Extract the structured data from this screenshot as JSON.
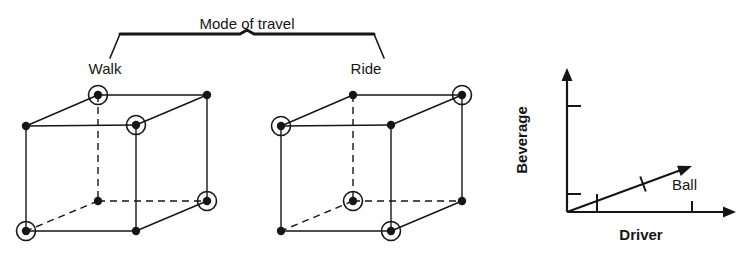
{
  "figure": {
    "width": 750,
    "height": 256,
    "background": "#ffffff",
    "ink_color": "#161616"
  },
  "factor_title": {
    "label": "Mode of travel",
    "x": 247,
    "y": 18
  },
  "groups": [
    {
      "id": "walk",
      "label": "Walk",
      "label_x": 105,
      "label_y": 74
    },
    {
      "id": "ride",
      "label": "Ride",
      "label_x": 366,
      "label_y": 74
    }
  ],
  "brace": {
    "left_x": 120,
    "right_x": 374,
    "top_y": 34,
    "tip_y": 30,
    "foot_y": 58,
    "center_x": 247
  },
  "cubes": [
    {
      "id": "cube-walk",
      "group": "Walk",
      "origin_x": 26,
      "front_top_y": 126,
      "front_bottom_y": 231,
      "front_width": 110,
      "depth_dx": 71,
      "depth_dy": -31,
      "vertices": [
        {
          "name": "front-top-left",
          "x": 26,
          "y": 126,
          "circled": false
        },
        {
          "name": "front-top-right",
          "x": 136,
          "y": 125,
          "circled": true
        },
        {
          "name": "front-bottom-left",
          "x": 26,
          "y": 231,
          "circled": true
        },
        {
          "name": "front-bottom-right",
          "x": 136,
          "y": 231,
          "circled": false
        },
        {
          "name": "back-top-left",
          "x": 98,
          "y": 95,
          "circled": true
        },
        {
          "name": "back-top-right",
          "x": 207,
          "y": 95,
          "circled": false
        },
        {
          "name": "back-bottom-left",
          "x": 98,
          "y": 201,
          "circled": false
        },
        {
          "name": "back-bottom-right",
          "x": 207,
          "y": 201,
          "circled": true
        }
      ]
    },
    {
      "id": "cube-ride",
      "group": "Ride",
      "origin_x": 281,
      "front_top_y": 126,
      "front_bottom_y": 231,
      "front_width": 110,
      "depth_dx": 71,
      "depth_dy": -31,
      "vertices": [
        {
          "name": "front-top-left",
          "x": 281,
          "y": 126,
          "circled": true
        },
        {
          "name": "front-top-right",
          "x": 391,
          "y": 125,
          "circled": false
        },
        {
          "name": "front-bottom-left",
          "x": 281,
          "y": 231,
          "circled": false
        },
        {
          "name": "front-bottom-right",
          "x": 391,
          "y": 231,
          "circled": true
        },
        {
          "name": "back-top-left",
          "x": 353,
          "y": 95,
          "circled": false
        },
        {
          "name": "back-top-right",
          "x": 462,
          "y": 95,
          "circled": true
        },
        {
          "name": "back-bottom-left",
          "x": 353,
          "y": 201,
          "circled": true
        },
        {
          "name": "back-bottom-right",
          "x": 462,
          "y": 201,
          "circled": false
        }
      ]
    }
  ],
  "chart_data": {
    "type": "line",
    "title": "",
    "xlabel": "Driver",
    "ylabel": "Beverage",
    "grid": false,
    "legend": "inline-annotation",
    "annotations": [
      {
        "text": "Ball",
        "x": 672,
        "y": 190
      }
    ],
    "axes": {
      "origin_x": 567,
      "origin_y": 212,
      "x_end": 736,
      "y_end": 68,
      "x_ticks": [
        {
          "x": 692,
          "length": 11
        }
      ],
      "y_ticks": [
        {
          "y": 106,
          "length": 14
        },
        {
          "y": 194,
          "length": 14
        }
      ]
    },
    "series": [
      {
        "name": "Ball",
        "x": [
          567,
          692
        ],
        "y": [
          212,
          166
        ],
        "ticks": [
          {
            "x": 597,
            "y": 201,
            "kind": "drop-to-axis"
          },
          {
            "x": 643,
            "y": 184,
            "kind": "perpendicular"
          }
        ]
      }
    ],
    "xlabel_pos": {
      "x": 641,
      "y": 240
    },
    "ylabel_pos": {
      "x": 527,
      "y": 140
    }
  }
}
